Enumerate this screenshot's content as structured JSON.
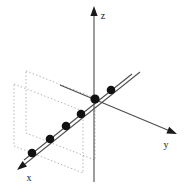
{
  "figure": {
    "width": 194,
    "height": 192,
    "background_color": "#ffffff"
  },
  "axes": {
    "origin": {
      "x": 95,
      "y": 99
    },
    "line_color": "#4d4d4d",
    "arrow_color": "#1a1a1a",
    "list": [
      {
        "name": "z",
        "label": "z",
        "label_x": 103,
        "label_y": 19,
        "x1": 94,
        "y1": 12,
        "x2": 94,
        "y2": 182,
        "arrow_tip_x": 94,
        "arrow_tip_y": 6,
        "arrow_angle_deg": -90
      },
      {
        "name": "y",
        "label": "y",
        "label_x": 166,
        "label_y": 148,
        "x1": 60,
        "y1": 85,
        "x2": 170,
        "y2": 131,
        "arrow_tip_x": 177,
        "arrow_tip_y": 134,
        "arrow_angle_deg": 22.7
      },
      {
        "name": "x",
        "label": "x",
        "label_x": 29,
        "label_y": 181,
        "x1": 140,
        "y1": 72,
        "x2": 25,
        "y2": 164,
        "arrow_tip_x": 17,
        "arrow_tip_y": 170,
        "arrow_angle_deg": 141.3
      }
    ]
  },
  "planes": {
    "stroke_color": "#b3b3b3",
    "dash_pattern": "1.4,2.2",
    "stroke_width": 1,
    "list": [
      {
        "name": "back-plane",
        "corners": [
          {
            "x": 26,
            "y": 71
          },
          {
            "x": 95,
            "y": 98
          },
          {
            "x": 95,
            "y": 160
          },
          {
            "x": 26,
            "y": 133
          }
        ]
      },
      {
        "name": "front-plane",
        "corners": [
          {
            "x": 14,
            "y": 84
          },
          {
            "x": 83,
            "y": 111
          },
          {
            "x": 83,
            "y": 173
          },
          {
            "x": 14,
            "y": 146
          }
        ]
      }
    ]
  },
  "data_line": {
    "name": "fitted-line",
    "color": "#4d4d4d",
    "stroke_width": 1.1,
    "x1": 24,
    "y1": 160,
    "x2": 132,
    "y2": 74
  },
  "points": {
    "fill_color": "#111111",
    "radius": 4.3,
    "list": [
      {
        "label": "p1",
        "x": 32,
        "y": 153
      },
      {
        "label": "p2",
        "x": 50,
        "y": 139
      },
      {
        "label": "p3",
        "x": 66,
        "y": 126
      },
      {
        "label": "p4",
        "x": 81,
        "y": 114
      },
      {
        "label": "p5",
        "x": 95,
        "y": 99
      },
      {
        "label": "p6",
        "x": 111,
        "y": 90
      }
    ]
  },
  "chart_data": {
    "type": "scatter",
    "title": "",
    "xlabel": "x",
    "ylabel": "y",
    "zlabel": "z",
    "projection": "3d",
    "grid": false,
    "legend": null,
    "annotations": [],
    "axis_labels": [
      "x",
      "y",
      "z"
    ],
    "screen_points": [
      [
        32,
        153
      ],
      [
        50,
        139
      ],
      [
        66,
        126
      ],
      [
        81,
        114
      ],
      [
        95,
        99
      ],
      [
        111,
        90
      ]
    ],
    "series": [
      {
        "name": "collinear points",
        "n_points": 6,
        "marker": "filled-circle",
        "through_origin": true,
        "fitted_line": true
      }
    ]
  }
}
